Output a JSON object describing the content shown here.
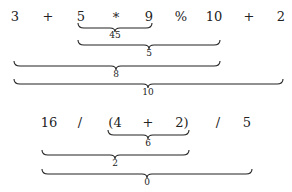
{
  "expressions": [
    {
      "tokens": [
        "3",
        "+",
        "5",
        "*",
        "9",
        "%",
        "10",
        "+",
        "2"
      ],
      "braces": [
        {
          "label": "45",
          "spans": "5 * 9"
        },
        {
          "label": "5",
          "spans": "5 * 9 % 10"
        },
        {
          "label": "8",
          "spans": "3 + 5 * 9 % 10"
        },
        {
          "label": "10",
          "spans": "3 + 5 * 9 % 10 + 2"
        }
      ]
    },
    {
      "tokens": [
        "16",
        "/",
        "(4",
        "+",
        "2)",
        "/",
        "5"
      ],
      "braces": [
        {
          "label": "6",
          "spans": "(4 + 2)"
        },
        {
          "label": "2",
          "spans": "16 / (4 + 2)"
        },
        {
          "label": "0",
          "spans": "16 / (4 + 2) / 5"
        }
      ]
    }
  ]
}
